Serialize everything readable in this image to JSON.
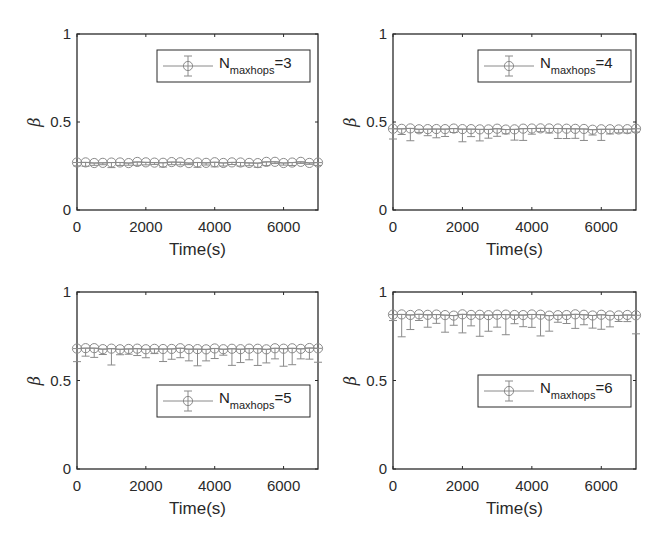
{
  "figure": {
    "layout": "2x2 subplots"
  },
  "chart_data": [
    {
      "type": "line",
      "panel": "top-left",
      "title": "",
      "xlabel": "Time(s)",
      "ylabel": "β",
      "xlim": [
        0,
        7000
      ],
      "ylim": [
        0,
        1
      ],
      "xticks": [
        "0",
        "2000",
        "4000",
        "6000"
      ],
      "yticks": [
        "0",
        "0.5",
        "1"
      ],
      "grid": false,
      "legend": {
        "position": "upper right",
        "entries": [
          {
            "label": "N",
            "subscript": "maxhops",
            "suffix": "=3",
            "marker": "circle-errorbar"
          }
        ]
      },
      "series": [
        {
          "name": "N_maxhops=3",
          "x_start": 0,
          "x_step": 250,
          "count": 29,
          "mean": 0.27,
          "err_lower": 0.02,
          "err_upper": 0.0
        }
      ]
    },
    {
      "type": "line",
      "panel": "top-right",
      "title": "",
      "xlabel": "Time(s)",
      "ylabel": "β",
      "xlim": [
        0,
        7000
      ],
      "ylim": [
        0,
        1
      ],
      "xticks": [
        "0",
        "2000",
        "4000",
        "6000"
      ],
      "yticks": [
        "0",
        "0.5",
        "1"
      ],
      "grid": false,
      "legend": {
        "position": "upper right",
        "entries": [
          {
            "label": "N",
            "subscript": "maxhops",
            "suffix": "=4",
            "marker": "circle-errorbar"
          }
        ]
      },
      "series": [
        {
          "name": "N_maxhops=4",
          "x_start": 0,
          "x_step": 250,
          "count": 29,
          "mean": 0.46,
          "err_lower": 0.05,
          "err_upper": 0.0
        }
      ]
    },
    {
      "type": "line",
      "panel": "bottom-left",
      "title": "",
      "xlabel": "Time(s)",
      "ylabel": "β",
      "xlim": [
        0,
        7000
      ],
      "ylim": [
        0,
        1
      ],
      "xticks": [
        "0",
        "2000",
        "4000",
        "6000"
      ],
      "yticks": [
        "0",
        "0.5",
        "1"
      ],
      "grid": false,
      "legend": {
        "position": "lower right",
        "entries": [
          {
            "label": "N",
            "subscript": "maxhops",
            "suffix": "=5",
            "marker": "circle-errorbar"
          }
        ]
      },
      "series": [
        {
          "name": "N_maxhops=5",
          "x_start": 0,
          "x_step": 250,
          "count": 29,
          "mean": 0.68,
          "err_lower": 0.07,
          "err_upper": 0.0
        }
      ]
    },
    {
      "type": "line",
      "panel": "bottom-right",
      "title": "",
      "xlabel": "Time(s)",
      "ylabel": "β",
      "xlim": [
        0,
        7000
      ],
      "ylim": [
        0,
        1
      ],
      "xticks": [
        "0",
        "2000",
        "4000",
        "6000"
      ],
      "yticks": [
        "0",
        "0.5",
        "1"
      ],
      "grid": false,
      "legend": {
        "position": "lower right",
        "entries": [
          {
            "label": "N",
            "subscript": "maxhops",
            "suffix": "=6",
            "marker": "circle-errorbar"
          }
        ]
      },
      "series": [
        {
          "name": "N_maxhops=6",
          "x_start": 0,
          "x_step": 250,
          "count": 29,
          "mean": 0.87,
          "err_lower": 0.09,
          "err_upper": 0.0
        }
      ]
    }
  ],
  "panels": [
    {
      "xlabel": "Time(s)",
      "ylabel": "β",
      "xticks": [
        "0",
        "2000",
        "4000",
        "6000"
      ],
      "yticks": [
        "0",
        "0.5",
        "1"
      ],
      "legend": {
        "N": "N",
        "sub": "maxhops",
        "val": "=3"
      }
    },
    {
      "xlabel": "Time(s)",
      "ylabel": "β",
      "xticks": [
        "0",
        "2000",
        "4000",
        "6000"
      ],
      "yticks": [
        "0",
        "0.5",
        "1"
      ],
      "legend": {
        "N": "N",
        "sub": "maxhops",
        "val": "=4"
      }
    },
    {
      "xlabel": "Time(s)",
      "ylabel": "β",
      "xticks": [
        "0",
        "2000",
        "4000",
        "6000"
      ],
      "yticks": [
        "0",
        "0.5",
        "1"
      ],
      "legend": {
        "N": "N",
        "sub": "maxhops",
        "val": "=5"
      }
    },
    {
      "xlabel": "Time(s)",
      "ylabel": "β",
      "xticks": [
        "0",
        "2000",
        "4000",
        "6000"
      ],
      "yticks": [
        "0",
        "0.5",
        "1"
      ],
      "legend": {
        "N": "N",
        "sub": "maxhops",
        "val": "=6"
      }
    }
  ],
  "colors": {
    "axis": "#2a2a2a",
    "series": "#8a8a8a",
    "background": "#ffffff"
  }
}
